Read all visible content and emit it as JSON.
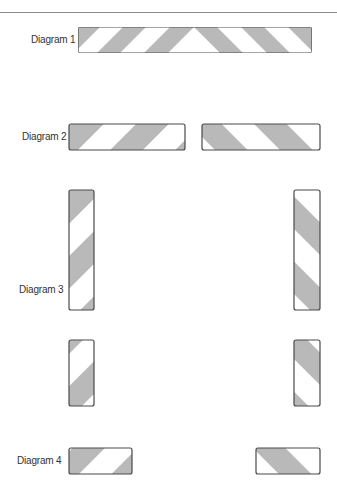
{
  "colors": {
    "stripe": "#b9b9b9",
    "background": "#ffffff",
    "outline": "#4a4a4a",
    "label": "#333333"
  },
  "labels": {
    "diagram1": "Diagram 1",
    "diagram2": "Diagram 2",
    "diagram3": "Diagram 3",
    "diagram4": "Diagram 4"
  },
  "diagrams": [
    {
      "id": "diagram-1",
      "label": "Diagram 1",
      "bars": [
        {
          "x": 78,
          "y": 27,
          "w": 234,
          "h": 26,
          "orientation": "horizontal",
          "pattern": "chevron-apex-center"
        }
      ]
    },
    {
      "id": "diagram-2",
      "label": "Diagram 2",
      "bars": [
        {
          "x": 69,
          "y": 124,
          "w": 116,
          "h": 26,
          "orientation": "horizontal",
          "pattern": "forward-slash"
        },
        {
          "x": 202,
          "y": 124,
          "w": 118,
          "h": 26,
          "orientation": "horizontal",
          "pattern": "back-slash"
        }
      ]
    },
    {
      "id": "diagram-3",
      "label": "Diagram 3",
      "bars": [
        {
          "x": 69,
          "y": 190,
          "w": 25,
          "h": 120,
          "orientation": "vertical",
          "pattern": "forward-slash"
        },
        {
          "x": 294,
          "y": 190,
          "w": 26,
          "h": 120,
          "orientation": "vertical",
          "pattern": "back-slash"
        },
        {
          "x": 69,
          "y": 340,
          "w": 25,
          "h": 66,
          "orientation": "vertical",
          "pattern": "forward-slash"
        },
        {
          "x": 294,
          "y": 340,
          "w": 26,
          "h": 66,
          "orientation": "vertical",
          "pattern": "back-slash"
        }
      ]
    },
    {
      "id": "diagram-4",
      "label": "Diagram 4",
      "bars": [
        {
          "x": 69,
          "y": 448,
          "w": 63,
          "h": 26,
          "orientation": "horizontal",
          "pattern": "forward-slash"
        },
        {
          "x": 256,
          "y": 448,
          "w": 64,
          "h": 26,
          "orientation": "horizontal",
          "pattern": "back-slash"
        }
      ]
    }
  ]
}
